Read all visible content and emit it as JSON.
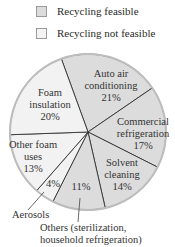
{
  "legend": [
    {
      "label": "Recycling feasible",
      "color": "#dcdcdc"
    },
    {
      "label": "Recycling not feasible",
      "color": "#f2f2f2"
    }
  ],
  "chart_data": {
    "type": "pie",
    "title": "",
    "categories": [
      "Auto air conditioning",
      "Commercial refrigeration",
      "Solvent cleaning",
      "Others (sterilization, household refrigeration)",
      "Aerosols",
      "Other foam uses",
      "Foam insulation"
    ],
    "values": [
      21,
      17,
      14,
      11,
      4,
      13,
      20
    ],
    "recycling_feasible": [
      true,
      true,
      true,
      true,
      false,
      false,
      false
    ],
    "legend": [
      "Recycling feasible",
      "Recycling not feasible"
    ],
    "legend_position": "top"
  },
  "labels": {
    "auto_1": "Auto air",
    "auto_2": "conditioning",
    "auto_3": "21%",
    "comm_1": "Commercial",
    "comm_2": "refrigeration",
    "comm_3": "17%",
    "solv_1": "Solvent",
    "solv_2": "cleaning",
    "solv_3": "14%",
    "others_pct": "11%",
    "aero_pct": "4%",
    "ofoam_1": "Other foam",
    "ofoam_2": "uses",
    "ofoam_3": "13%",
    "foam_1": "Foam",
    "foam_2": "insulation",
    "foam_3": "20%",
    "aerosols": "Aerosols",
    "others_1": "Others (sterilization,",
    "others_2": "household refrigeration)"
  }
}
